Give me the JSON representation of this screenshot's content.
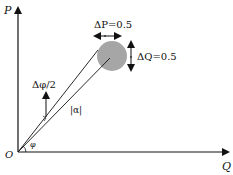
{
  "diagram": {
    "axes": {
      "y_label": "P",
      "x_label": "Q",
      "origin_label": "O"
    },
    "labels": {
      "delta_p": "ΔP=0.5",
      "delta_q": "ΔQ=0.5",
      "delta_phi": "Δφ/2",
      "alpha_mag": "|α|",
      "phi": "φ"
    },
    "colors": {
      "circle_fill": "#a6a6a6",
      "line": "#111111",
      "background": "#ffffff"
    }
  }
}
